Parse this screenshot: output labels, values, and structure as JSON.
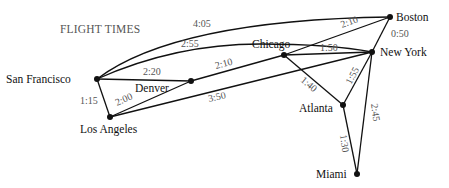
{
  "title": "FLIGHT TIMES",
  "cities": [
    {
      "id": "sf",
      "label": "San Francisco",
      "x": 97,
      "y": 79,
      "lx": 6,
      "ly": 83,
      "anchor": "start"
    },
    {
      "id": "den",
      "label": "Denver",
      "x": 191,
      "y": 81,
      "lx": 135,
      "ly": 92,
      "anchor": "start"
    },
    {
      "id": "la",
      "label": "Los Angeles",
      "x": 110,
      "y": 117,
      "lx": 80,
      "ly": 133,
      "anchor": "start"
    },
    {
      "id": "chi",
      "label": "Chicago",
      "x": 284,
      "y": 55,
      "lx": 252,
      "ly": 48,
      "anchor": "start"
    },
    {
      "id": "ny",
      "label": "New York",
      "x": 372,
      "y": 52,
      "lx": 380,
      "ly": 56,
      "anchor": "start"
    },
    {
      "id": "bos",
      "label": "Boston",
      "x": 390,
      "y": 17,
      "lx": 396,
      "ly": 20,
      "anchor": "start"
    },
    {
      "id": "atl",
      "label": "Atlanta",
      "x": 343,
      "y": 105,
      "lx": 296,
      "ly": 112,
      "anchor": "start"
    },
    {
      "id": "mia",
      "label": "Miami",
      "x": 357,
      "y": 174,
      "lx": 316,
      "ly": 178,
      "anchor": "start"
    }
  ],
  "routes": [
    {
      "from": "San Francisco",
      "to": "Boston",
      "time": "4:05"
    },
    {
      "from": "San Francisco",
      "to": "New York",
      "time": "2:55"
    },
    {
      "from": "San Francisco",
      "to": "Denver",
      "time": "2:20"
    },
    {
      "from": "San Francisco",
      "to": "Los Angeles",
      "time": "1:15"
    },
    {
      "from": "Los Angeles",
      "to": "Denver",
      "time": "2:00"
    },
    {
      "from": "Los Angeles",
      "to": "New York",
      "time": "3:50"
    },
    {
      "from": "Denver",
      "to": "Chicago",
      "time": "2:10"
    },
    {
      "from": "Chicago",
      "to": "Boston",
      "time": "2:10"
    },
    {
      "from": "Chicago",
      "to": "New York",
      "time": "1:50"
    },
    {
      "from": "Chicago",
      "to": "Atlanta",
      "time": "1:40"
    },
    {
      "from": "Boston",
      "to": "New York",
      "time": "0:50"
    },
    {
      "from": "Atlanta",
      "to": "New York",
      "time": "1:55"
    },
    {
      "from": "New York",
      "to": "Miami",
      "time": "2:45"
    },
    {
      "from": "Atlanta",
      "to": "Miami",
      "time": "1:30"
    }
  ],
  "labels": {
    "sf": "San Francisco",
    "den": "Denver",
    "la": "Los Angeles",
    "chi": "Chicago",
    "ny": "New York",
    "bos": "Boston",
    "atl": "Atlanta",
    "mia": "Miami",
    "t_sf_bos": "4:05",
    "t_sf_ny": "2:55",
    "t_sf_den": "2:20",
    "t_sf_la": "1:15",
    "t_la_den": "2:00",
    "t_la_ny": "3:50",
    "t_den_chi": "2:10",
    "t_chi_bos": "2:10",
    "t_chi_ny": "1:50",
    "t_chi_atl": "1:40",
    "t_bos_ny": "0:50",
    "t_atl_ny": "1:55",
    "t_ny_mia": "2:45",
    "t_atl_mia": "1:30"
  }
}
